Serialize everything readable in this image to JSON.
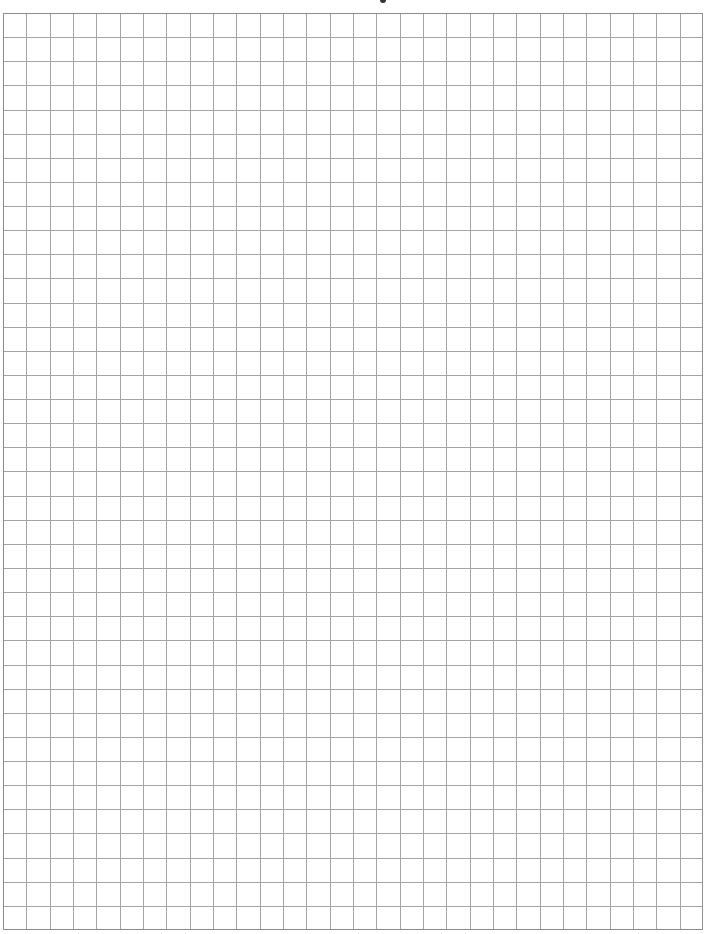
{
  "page": {
    "type": "graph-paper",
    "background_color": "#ffffff"
  },
  "grid": {
    "columns": 30,
    "rows": 38,
    "line_color": "#a4a4a4",
    "border_color": "#8c8c8c",
    "cell_width_px": 23.33,
    "cell_height_px": 24.13
  },
  "header": {
    "cropped_text_fragment": ""
  }
}
